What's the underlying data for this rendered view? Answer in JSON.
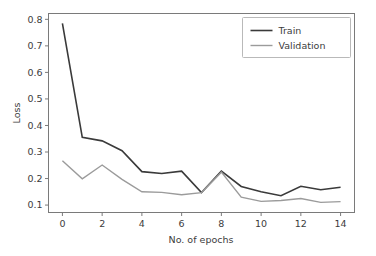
{
  "chart_data": {
    "type": "line",
    "title": "",
    "xlabel": "No. of epochs",
    "ylabel": "Loss",
    "x": [
      0,
      1,
      2,
      3,
      4,
      5,
      6,
      7,
      8,
      9,
      10,
      11,
      12,
      13,
      14
    ],
    "xlim": [
      -0.7,
      14.7
    ],
    "ylim": [
      0.072,
      0.822
    ],
    "xticks": [
      0,
      2,
      4,
      6,
      8,
      10,
      12,
      14
    ],
    "xticklabels": [
      "0",
      "2",
      "4",
      "6",
      "8",
      "10",
      "12",
      "14"
    ],
    "yticks": [
      0.1,
      0.2,
      0.3,
      0.4,
      0.5,
      0.6,
      0.7,
      0.8
    ],
    "yticklabels": [
      "0.1",
      "0.2",
      "0.3",
      "0.4",
      "0.5",
      "0.6",
      "0.7",
      "0.8"
    ],
    "grid": false,
    "legend_position": "upper right",
    "series": [
      {
        "name": "Train",
        "color": "#3a3a3a",
        "linewidth": 1.6,
        "values": [
          0.785,
          0.355,
          0.342,
          0.305,
          0.226,
          0.219,
          0.228,
          0.147,
          0.228,
          0.17,
          0.15,
          0.135,
          0.171,
          0.158,
          0.167
        ]
      },
      {
        "name": "Validation",
        "color": "#9b9b9b",
        "linewidth": 1.4,
        "values": [
          0.267,
          0.199,
          0.251,
          0.197,
          0.15,
          0.148,
          0.139,
          0.147,
          0.224,
          0.13,
          0.114,
          0.117,
          0.125,
          0.11,
          0.113
        ]
      }
    ]
  },
  "legend": {
    "entries": [
      {
        "label": "Train"
      },
      {
        "label": "Validation"
      }
    ]
  },
  "axes": {
    "y_title": "Loss",
    "x_title": "No. of epochs"
  },
  "colors": {
    "background": "#ffffff",
    "spine": "#7a7a7a",
    "text": "#3c3c3c",
    "train": "#3a3a3a",
    "validation": "#9b9b9b"
  }
}
